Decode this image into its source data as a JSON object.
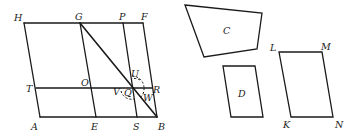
{
  "diagram": {
    "left_figure": {
      "labels": {
        "H": "H",
        "G": "G",
        "P": "P",
        "F": "F",
        "T": "T",
        "O": "O",
        "U": "U",
        "V": "V",
        "Q": "Q",
        "W": "W",
        "R": "R",
        "A": "A",
        "E": "E",
        "S": "S",
        "B": "B"
      }
    },
    "shapes": {
      "C": "C",
      "D": "D",
      "L": "L",
      "M": "M",
      "K": "K",
      "N": "N"
    },
    "colors": {
      "stroke": "#1a1a1a",
      "background": "#ffffff"
    }
  }
}
